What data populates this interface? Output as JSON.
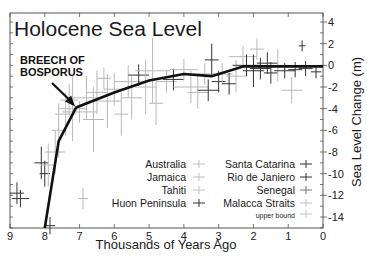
{
  "chart_data": {
    "type": "line",
    "title": "Holocene Sea Level",
    "xlabel": "Thousands of Years Ago",
    "ylabel": "Sea Level Change (m)",
    "xlim": [
      9,
      0
    ],
    "ylim": [
      -15.5,
      5
    ],
    "x_ticks": [
      9,
      8,
      7,
      6,
      5,
      4,
      3,
      2,
      1,
      0
    ],
    "y_ticks": [
      4,
      2,
      0,
      -2,
      -4,
      -6,
      -8,
      -10,
      -12,
      -14
    ],
    "grid": false,
    "annotation": {
      "lines": [
        "BREECH OF",
        "BOSPORUS"
      ],
      "points_to": {
        "x": 7.1,
        "y": -3.9
      }
    },
    "series": [
      {
        "name": "Sea level curve",
        "x": [
          8.0,
          7.6,
          7.1,
          6.0,
          5.0,
          4.0,
          3.2,
          2.3,
          1.0,
          0.0
        ],
        "y": [
          -15.5,
          -7.0,
          -3.9,
          -2.5,
          -1.4,
          -0.8,
          -1.0,
          -0.1,
          -0.1,
          -0.1
        ]
      }
    ],
    "scatter_points": [
      {
        "x": 8.8,
        "y": -11.8,
        "ex": 0.2,
        "ey": 1.0,
        "dark": true
      },
      {
        "x": 8.7,
        "y": -12.3,
        "ex": 0.25,
        "ey": 0.8,
        "dark": true
      },
      {
        "x": 8.1,
        "y": -9.0,
        "ex": 0.2,
        "ey": 1.5,
        "dark": true
      },
      {
        "x": 8.0,
        "y": -10.0,
        "ex": 0.15,
        "ey": 1.2,
        "dark": true
      },
      {
        "x": 7.9,
        "y": -9.2,
        "ex": 0.2,
        "ey": 2.0,
        "dark": false
      },
      {
        "x": 7.85,
        "y": -14.8,
        "ex": 0.15,
        "ey": 0.8,
        "dark": true
      },
      {
        "x": 7.7,
        "y": -8.0,
        "ex": 0.3,
        "ey": 2.0,
        "dark": false
      },
      {
        "x": 7.6,
        "y": -6.0,
        "ex": 0.2,
        "ey": 2.5,
        "dark": false
      },
      {
        "x": 7.4,
        "y": -4.5,
        "ex": 0.3,
        "ey": 2.0,
        "dark": false
      },
      {
        "x": 7.3,
        "y": -3.2,
        "ex": 0.25,
        "ey": 1.5,
        "dark": false
      },
      {
        "x": 7.2,
        "y": -4.0,
        "ex": 0.4,
        "ey": 3.0,
        "dark": false
      },
      {
        "x": 7.0,
        "y": -4.3,
        "ex": 0.5,
        "ey": 1.0,
        "dark": false
      },
      {
        "x": 6.9,
        "y": -12.3,
        "ex": 0.15,
        "ey": 1.0,
        "dark": false
      },
      {
        "x": 6.8,
        "y": -3.0,
        "ex": 0.4,
        "ey": 2.0,
        "dark": false
      },
      {
        "x": 6.6,
        "y": -5.0,
        "ex": 0.3,
        "ey": 3.0,
        "dark": false
      },
      {
        "x": 6.5,
        "y": -2.5,
        "ex": 0.3,
        "ey": 2.0,
        "dark": false
      },
      {
        "x": 6.3,
        "y": -1.2,
        "ex": 0.2,
        "ey": 1.0,
        "dark": false
      },
      {
        "x": 6.2,
        "y": -3.3,
        "ex": 0.4,
        "ey": 2.5,
        "dark": false
      },
      {
        "x": 6.0,
        "y": -2.2,
        "ex": 0.3,
        "ey": 1.5,
        "dark": false
      },
      {
        "x": 5.8,
        "y": -4.5,
        "ex": 0.2,
        "ey": 2.0,
        "dark": false
      },
      {
        "x": 5.6,
        "y": -1.5,
        "ex": 0.4,
        "ey": 1.5,
        "dark": false
      },
      {
        "x": 5.5,
        "y": -3.0,
        "ex": 0.3,
        "ey": 2.0,
        "dark": false
      },
      {
        "x": 5.3,
        "y": -0.9,
        "ex": 0.3,
        "ey": 1.0,
        "dark": true
      },
      {
        "x": 5.1,
        "y": -2.0,
        "ex": 0.3,
        "ey": 2.5,
        "dark": false
      },
      {
        "x": 4.9,
        "y": -0.5,
        "ex": 0.5,
        "ey": 3.0,
        "dark": false
      },
      {
        "x": 4.8,
        "y": -3.5,
        "ex": 0.2,
        "ey": 2.0,
        "dark": false
      },
      {
        "x": 4.5,
        "y": -1.5,
        "ex": 0.3,
        "ey": 1.0,
        "dark": false
      },
      {
        "x": 4.3,
        "y": -1.3,
        "ex": 0.3,
        "ey": 1.0,
        "dark": true
      },
      {
        "x": 4.0,
        "y": -0.4,
        "ex": 0.4,
        "ey": 1.0,
        "dark": false
      },
      {
        "x": 3.8,
        "y": -2.0,
        "ex": 0.5,
        "ey": 1.5,
        "dark": false
      },
      {
        "x": 3.6,
        "y": -2.5,
        "ex": 0.3,
        "ey": 1.5,
        "dark": false
      },
      {
        "x": 3.4,
        "y": -0.8,
        "ex": 0.3,
        "ey": 1.0,
        "dark": false
      },
      {
        "x": 3.3,
        "y": -2.3,
        "ex": 0.3,
        "ey": 1.0,
        "dark": true
      },
      {
        "x": 3.2,
        "y": 0.5,
        "ex": 0.2,
        "ey": 1.5,
        "dark": true
      },
      {
        "x": 3.0,
        "y": -1.5,
        "ex": 0.2,
        "ey": 1.0,
        "dark": true
      },
      {
        "x": 2.9,
        "y": -0.8,
        "ex": 0.3,
        "ey": 1.0,
        "dark": false
      },
      {
        "x": 2.7,
        "y": -1.7,
        "ex": 0.2,
        "ey": 1.0,
        "dark": true
      },
      {
        "x": 2.5,
        "y": -1.0,
        "ex": 0.3,
        "ey": 1.5,
        "dark": false
      },
      {
        "x": 2.3,
        "y": 0.8,
        "ex": 0.4,
        "ey": 1.0,
        "dark": false
      },
      {
        "x": 2.2,
        "y": 0.0,
        "ex": 0.4,
        "ey": 1.0,
        "dark": true
      },
      {
        "x": 2.0,
        "y": -0.5,
        "ex": 0.3,
        "ey": 1.5,
        "dark": true
      },
      {
        "x": 1.9,
        "y": 1.5,
        "ex": 0.2,
        "ey": 1.0,
        "dark": false
      },
      {
        "x": 1.8,
        "y": -0.3,
        "ex": 0.3,
        "ey": 1.0,
        "dark": true
      },
      {
        "x": 1.6,
        "y": 0.2,
        "ex": 0.3,
        "ey": 1.0,
        "dark": true
      },
      {
        "x": 1.5,
        "y": -0.7,
        "ex": 0.2,
        "ey": 1.0,
        "dark": true
      },
      {
        "x": 1.3,
        "y": 0.0,
        "ex": 0.3,
        "ey": 1.5,
        "dark": false
      },
      {
        "x": 1.1,
        "y": -0.5,
        "ex": 0.3,
        "ey": 0.7,
        "dark": true
      },
      {
        "x": 0.9,
        "y": -2.3,
        "ex": 0.3,
        "ey": 1.2,
        "dark": false
      },
      {
        "x": 0.8,
        "y": -0.4,
        "ex": 0.2,
        "ey": 0.7,
        "dark": true
      },
      {
        "x": 0.6,
        "y": 1.8,
        "ex": 0.1,
        "ey": 0.5,
        "dark": true
      },
      {
        "x": 0.5,
        "y": -0.3,
        "ex": 0.2,
        "ey": 0.7,
        "dark": true
      },
      {
        "x": 0.2,
        "y": -0.6,
        "ex": 0.15,
        "ey": 0.6,
        "dark": true
      }
    ],
    "legend": {
      "placement": "bottom-right",
      "left_column": [
        {
          "label": "Australia",
          "tone": "light"
        },
        {
          "label": "Jamaica",
          "tone": "light"
        },
        {
          "label": "Tahiti",
          "tone": "light"
        },
        {
          "label": "Huon Peninsula",
          "tone": "dark"
        }
      ],
      "right_column": [
        {
          "label": "Santa Catarina",
          "tone": "dark"
        },
        {
          "label": "Rio de Janiero",
          "tone": "dark"
        },
        {
          "label": "Senegal",
          "tone": "medium"
        },
        {
          "label": "Malacca Straits",
          "tone": "light"
        },
        {
          "label": "upper bound",
          "tone": "light",
          "small": true
        }
      ]
    }
  },
  "colors": {
    "curve": "#111111",
    "dark_marker": "#333333",
    "light_marker": "#b8b8b8",
    "axis": "#555555"
  }
}
